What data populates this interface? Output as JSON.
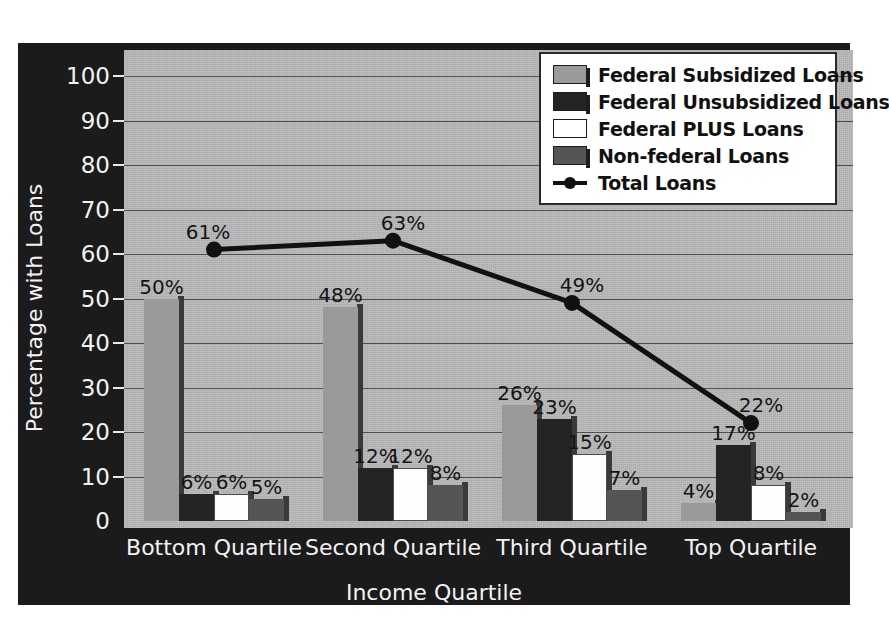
{
  "chart_data": {
    "type": "bar",
    "title": "",
    "xlabel": "Income Quartile",
    "ylabel": "Percentage with Loans",
    "ylim": [
      0,
      100
    ],
    "ytick_step": 10,
    "grid": true,
    "legend_position": "top-right",
    "categories": [
      "Bottom Quartile",
      "Second Quartile",
      "Third Quartile",
      "Top Quartile"
    ],
    "ytick_labels": [
      "100",
      "90",
      "80",
      "70",
      "60",
      "50",
      "40",
      "30",
      "20",
      "10",
      "0"
    ],
    "series": [
      {
        "name": "Federal Subsidized Loans",
        "type": "bar",
        "color": "#9a9a9a",
        "values": [
          50,
          48,
          26,
          4
        ],
        "labels": [
          "50%",
          "48%",
          "26%",
          "4%"
        ]
      },
      {
        "name": "Federal Unsubsidized Loans",
        "type": "bar",
        "color": "#242424",
        "values": [
          6,
          12,
          23,
          17
        ],
        "labels": [
          "6%",
          "12%",
          "23%",
          "17%"
        ]
      },
      {
        "name": "Federal PLUS Loans",
        "type": "bar",
        "color": "#fdfdfd",
        "values": [
          6,
          12,
          15,
          8
        ],
        "labels": [
          "6%",
          "12%",
          "15%",
          "8%"
        ]
      },
      {
        "name": "Non-federal Loans",
        "type": "bar",
        "color": "#555555",
        "values": [
          5,
          8,
          7,
          2
        ],
        "labels": [
          "5%",
          "8%",
          "7%",
          "2%"
        ]
      },
      {
        "name": "Total Loans",
        "type": "line",
        "color": "#111111",
        "values": [
          61,
          63,
          49,
          22
        ],
        "labels": [
          "61%",
          "63%",
          "49%",
          "22%"
        ]
      }
    ]
  },
  "legend": {
    "items": [
      {
        "label": "Federal Subsidized Loans",
        "marker": "swatch-gray"
      },
      {
        "label": "Federal Unsubsidized Loans",
        "marker": "swatch-black"
      },
      {
        "label": "Federal PLUS Loans",
        "marker": "swatch-white"
      },
      {
        "label": "Non-federal Loans",
        "marker": "swatch-darkgray"
      },
      {
        "label": "Total Loans",
        "marker": "line-dot"
      }
    ]
  },
  "colors": {
    "panel_background": "#1b1b1b",
    "plot_background": "#b8b8b8",
    "gridline": "#4e4e4e",
    "axis_text": "#f2f2f2",
    "data_label": "#141414"
  }
}
